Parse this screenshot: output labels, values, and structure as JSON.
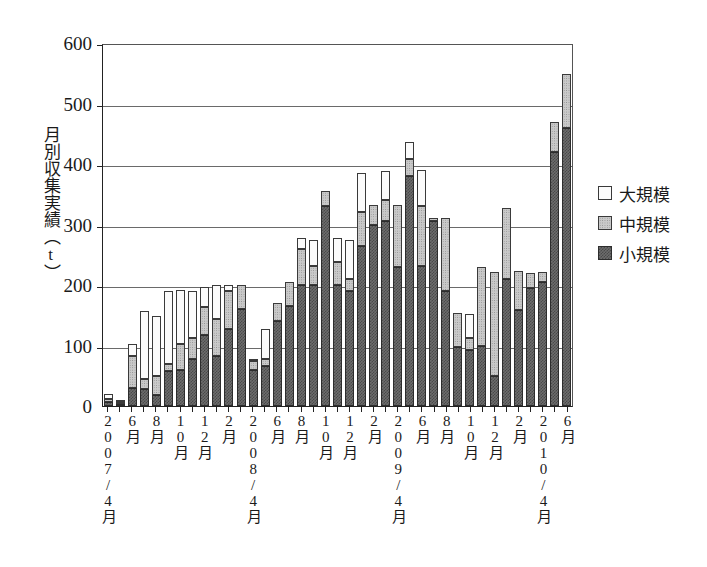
{
  "chart_data": {
    "type": "bar",
    "stacked": true,
    "title": "",
    "xlabel": "",
    "ylabel": "月別収集実績（t）",
    "ylim": [
      0,
      600
    ],
    "yticks": [
      0,
      100,
      200,
      300,
      400,
      500,
      600
    ],
    "grid": "horizontal",
    "legend_position": "right",
    "legend": [
      "大規模",
      "中規模",
      "小規模"
    ],
    "axis_group_labels": [
      "2007/4月",
      "2008/4月",
      "2009/4月",
      "2010/4月"
    ],
    "categories": [
      "2007/4月",
      "5月",
      "6月",
      "7月",
      "8月",
      "9月",
      "10月",
      "11月",
      "12月",
      "1月",
      "2月",
      "3月",
      "2008/4月",
      "5月",
      "6月",
      "7月",
      "8月",
      "9月",
      "10月",
      "11月",
      "12月",
      "1月",
      "2月",
      "3月",
      "2009/4月",
      "5月",
      "6月",
      "7月",
      "8月",
      "9月",
      "10月",
      "11月",
      "12月",
      "1月",
      "2月",
      "3月",
      "2010/4月",
      "5月",
      "6月"
    ],
    "tick_labels": [
      "2007/4月",
      "",
      "6月",
      "",
      "8月",
      "",
      "10月",
      "",
      "12月",
      "",
      "2月",
      "",
      "2008/4月",
      "",
      "6月",
      "",
      "8月",
      "",
      "10月",
      "",
      "12月",
      "",
      "2月",
      "",
      "2009/4月",
      "",
      "6月",
      "",
      "8月",
      "",
      "10月",
      "",
      "12月",
      "",
      "2月",
      "",
      "2010/4月",
      "",
      "6月"
    ],
    "series": [
      {
        "name": "小規模",
        "color": "#6d6d6d",
        "values": [
          6,
          4,
          30,
          28,
          18,
          58,
          60,
          78,
          118,
          82,
          128,
          160,
          60,
          66,
          140,
          165,
          200,
          200,
          330,
          200,
          190,
          265,
          300,
          305,
          230,
          380,
          232,
          305,
          190,
          98,
          92,
          100,
          50,
          210,
          158,
          195,
          205,
          420,
          460
        ]
      },
      {
        "name": "中規模",
        "color": "#c9c9c9",
        "values": [
          6,
          3,
          52,
          16,
          32,
          12,
          42,
          34,
          45,
          62,
          62,
          40,
          14,
          12,
          30,
          40,
          60,
          31,
          25,
          38,
          20,
          55,
          33,
          36,
          102,
          28,
          98,
          5,
          120,
          55,
          20,
          130,
          172,
          118,
          66,
          25,
          16,
          50,
          88
        ]
      },
      {
        "name": "大規模",
        "color": "#fbfbfb",
        "values": [
          8,
          2,
          20,
          113,
          98,
          120,
          90,
          78,
          33,
          56,
          10,
          0,
          4,
          50,
          0,
          0,
          18,
          43,
          0,
          40,
          65,
          65,
          0,
          47,
          0,
          28,
          60,
          0,
          0,
          0,
          40,
          0,
          0,
          0,
          0,
          0,
          0,
          0,
          0
        ]
      }
    ],
    "totals": [
      20,
      9,
      102,
      157,
      148,
      190,
      192,
      190,
      196,
      200,
      200,
      200,
      78,
      128,
      170,
      205,
      278,
      274,
      355,
      278,
      275,
      385,
      333,
      388,
      332,
      436,
      390,
      310,
      310,
      153,
      152,
      230,
      222,
      328,
      224,
      220,
      221,
      470,
      548
    ]
  }
}
